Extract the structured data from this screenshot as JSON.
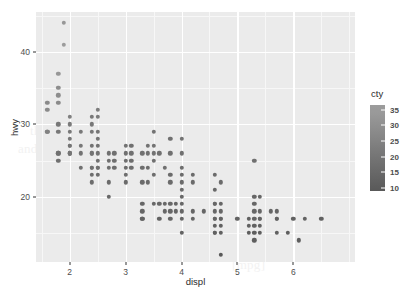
{
  "figure": {
    "panel_bg": "#ebebeb",
    "grid_color": "#ffffff",
    "point_color": "#4a4a4a"
  },
  "watermark": {
    "lines": [
      "the document text showing faintly behind the figure",
      "and a second line of body copy beneath the panel area",
      "Other introduction",
      "[mpg]"
    ]
  },
  "chart_data": {
    "type": "scatter",
    "title": "",
    "xlabel": "displ",
    "ylabel": "hwy",
    "xlim": [
      1.4,
      7.1
    ],
    "ylim": [
      11,
      45.5
    ],
    "xticks": [
      2,
      3,
      4,
      5,
      6
    ],
    "yticks": [
      20,
      30,
      40
    ],
    "grid": true,
    "legend": {
      "title": "cty",
      "position": "right",
      "type": "colorbar",
      "ticks": [
        35,
        30,
        25,
        20,
        15,
        10
      ],
      "range": [
        9,
        35
      ],
      "low_color": "#132b43",
      "high_color": "#56b1f7",
      "low_color_gray": "#595959",
      "high_color_gray": "#9c9c9c"
    },
    "color_by": "cty",
    "n_points": 234,
    "x": [
      1.8,
      1.8,
      2.0,
      2.0,
      2.8,
      2.8,
      3.1,
      1.8,
      1.8,
      2.0,
      2.0,
      2.8,
      2.8,
      3.1,
      3.1,
      2.8,
      3.1,
      4.2,
      5.3,
      5.3,
      5.3,
      5.7,
      6.0,
      5.7,
      5.7,
      6.2,
      6.2,
      7.0,
      5.3,
      5.3,
      5.7,
      6.5,
      2.4,
      2.4,
      3.1,
      3.5,
      3.6,
      2.4,
      3.0,
      3.3,
      3.3,
      3.3,
      3.3,
      3.3,
      3.8,
      3.8,
      3.8,
      4.0,
      3.7,
      3.7,
      3.9,
      3.9,
      4.7,
      4.7,
      4.7,
      5.2,
      5.2,
      3.9,
      4.7,
      4.7,
      4.7,
      5.2,
      5.7,
      5.9,
      4.7,
      4.7,
      4.7,
      4.7,
      4.7,
      4.7,
      5.2,
      5.2,
      5.7,
      5.9,
      4.6,
      5.4,
      5.4,
      4.0,
      4.0,
      4.6,
      5.0,
      4.2,
      4.2,
      4.6,
      4.6,
      4.6,
      5.4,
      5.4,
      3.8,
      3.8,
      4.0,
      4.0,
      4.6,
      4.6,
      4.6,
      4.6,
      5.4,
      1.6,
      1.6,
      1.6,
      1.6,
      1.6,
      1.8,
      1.8,
      1.8,
      2.0,
      2.4,
      2.4,
      2.4,
      2.4,
      2.5,
      2.5,
      3.3,
      2.0,
      2.0,
      2.0,
      2.0,
      2.7,
      2.7,
      2.7,
      3.0,
      3.7,
      4.0,
      4.7,
      4.7,
      4.7,
      5.7,
      6.1,
      4.0,
      4.2,
      4.4,
      4.6,
      5.4,
      5.4,
      5.4,
      4.0,
      4.0,
      4.6,
      5.0,
      2.4,
      2.4,
      2.5,
      2.5,
      3.5,
      3.5,
      3.0,
      3.0,
      3.5,
      3.3,
      3.3,
      4.0,
      5.6,
      3.1,
      3.8,
      3.8,
      3.8,
      5.3,
      2.5,
      2.5,
      2.5,
      2.5,
      2.5,
      2.5,
      2.2,
      2.2,
      2.5,
      2.5,
      2.5,
      2.5,
      2.5,
      2.5,
      2.7,
      2.7,
      3.4,
      3.4,
      4.0,
      4.7,
      2.2,
      2.2,
      2.4,
      2.4,
      3.0,
      3.0,
      3.5,
      2.2,
      2.2,
      2.4,
      2.4,
      3.0,
      3.0,
      3.3,
      1.8,
      1.8,
      1.8,
      1.8,
      1.8,
      4.7,
      5.7,
      2.7,
      2.7,
      2.7,
      3.4,
      3.4,
      4.0,
      4.0,
      2.0,
      2.0,
      2.0,
      2.0,
      2.8,
      1.9,
      2.0,
      2.0,
      2.0,
      2.0,
      2.5,
      2.5,
      2.8,
      2.8,
      1.9,
      1.9,
      2.0,
      2.0,
      2.5,
      2.5,
      1.8,
      1.8,
      2.0,
      2.0,
      2.8,
      2.8,
      3.6
    ],
    "y": [
      29,
      29,
      31,
      30,
      26,
      26,
      27,
      26,
      25,
      28,
      27,
      25,
      25,
      25,
      25,
      24,
      25,
      23,
      20,
      15,
      20,
      17,
      17,
      26,
      23,
      26,
      25,
      24,
      19,
      14,
      15,
      17,
      27,
      30,
      26,
      29,
      26,
      24,
      24,
      22,
      22,
      24,
      24,
      17,
      22,
      21,
      23,
      23,
      19,
      18,
      17,
      17,
      19,
      19,
      12,
      17,
      15,
      17,
      17,
      12,
      17,
      16,
      18,
      18,
      16,
      16,
      16,
      16,
      16,
      17,
      17,
      17,
      16,
      16,
      17,
      17,
      17,
      17,
      17,
      17,
      16,
      16,
      17,
      17,
      18,
      17,
      16,
      16,
      17,
      17,
      17,
      17,
      16,
      17,
      17,
      17,
      16,
      26,
      29,
      29,
      29,
      29,
      26,
      29,
      29,
      29,
      26,
      26,
      24,
      24,
      24,
      22,
      22,
      29,
      29,
      29,
      29,
      26,
      26,
      26,
      22,
      22,
      19,
      19,
      19,
      19,
      17,
      17,
      17,
      17,
      17,
      17,
      16,
      16,
      16,
      18,
      18,
      17,
      17,
      24,
      24,
      24,
      24,
      23,
      22,
      20,
      20,
      23,
      23,
      22,
      23,
      22,
      20,
      20,
      22,
      20,
      19,
      19,
      22,
      22,
      22,
      22,
      26,
      26,
      26,
      26,
      26,
      26,
      26,
      25,
      24,
      24,
      24,
      23,
      23,
      22,
      22,
      22,
      22,
      22,
      22,
      22,
      22,
      22,
      22,
      22,
      22,
      22,
      22,
      22,
      20,
      20,
      18,
      18,
      18,
      18,
      17,
      17,
      17,
      17,
      17,
      17,
      17,
      22,
      21,
      21,
      22,
      22,
      20,
      20,
      20,
      20,
      26,
      26,
      26,
      26,
      26,
      26,
      26,
      26,
      26,
      26,
      26,
      26,
      26,
      26,
      26,
      26,
      26,
      26,
      26,
      26,
      26,
      26,
      26,
      26,
      26,
      26,
      26,
      26,
      26,
      26,
      26,
      26,
      26,
      26,
      26,
      26,
      26,
      26,
      26,
      26,
      26,
      26,
      26,
      26,
      26,
      26,
      26,
      26,
      26,
      26,
      26,
      26,
      26,
      26,
      26,
      26,
      26,
      26,
      26,
      26,
      26,
      26,
      26,
      26,
      26,
      26,
      26,
      26,
      26,
      26,
      26,
      26,
      26,
      26,
      26,
      26,
      26,
      26,
      26,
      26,
      26,
      26,
      26,
      26,
      26
    ],
    "series_description": "mpg dataset: highway MPG versus engine displacement, points shaded by city MPG"
  },
  "points": [
    {
      "x": 1.6,
      "y": 33,
      "c": 28
    },
    {
      "x": 1.6,
      "y": 32,
      "c": 28
    },
    {
      "x": 1.6,
      "y": 29,
      "c": 24
    },
    {
      "x": 1.8,
      "y": 37,
      "c": 33
    },
    {
      "x": 1.8,
      "y": 35,
      "c": 29
    },
    {
      "x": 1.8,
      "y": 34,
      "c": 29
    },
    {
      "x": 1.8,
      "y": 33,
      "c": 28
    },
    {
      "x": 1.8,
      "y": 30,
      "c": 21
    },
    {
      "x": 1.8,
      "y": 29,
      "c": 21
    },
    {
      "x": 1.8,
      "y": 26,
      "c": 18
    },
    {
      "x": 1.8,
      "y": 26,
      "c": 18
    },
    {
      "x": 1.8,
      "y": 25,
      "c": 18
    },
    {
      "x": 1.9,
      "y": 44,
      "c": 33
    },
    {
      "x": 1.9,
      "y": 41,
      "c": 35
    },
    {
      "x": 2.0,
      "y": 31,
      "c": 24
    },
    {
      "x": 2.0,
      "y": 30,
      "c": 22
    },
    {
      "x": 2.0,
      "y": 29,
      "c": 21
    },
    {
      "x": 2.0,
      "y": 28,
      "c": 21
    },
    {
      "x": 2.0,
      "y": 27,
      "c": 21
    },
    {
      "x": 2.0,
      "y": 26,
      "c": 19
    },
    {
      "x": 2.0,
      "y": 26,
      "c": 19
    },
    {
      "x": 2.2,
      "y": 29,
      "c": 21
    },
    {
      "x": 2.2,
      "y": 26,
      "c": 19
    },
    {
      "x": 2.4,
      "y": 31,
      "c": 21
    },
    {
      "x": 2.4,
      "y": 30,
      "c": 21
    },
    {
      "x": 2.4,
      "y": 29,
      "c": 21
    },
    {
      "x": 2.4,
      "y": 27,
      "c": 19
    },
    {
      "x": 2.4,
      "y": 26,
      "c": 19
    },
    {
      "x": 2.4,
      "y": 24,
      "c": 18
    },
    {
      "x": 2.4,
      "y": 24,
      "c": 18
    },
    {
      "x": 2.4,
      "y": 23,
      "c": 17
    },
    {
      "x": 2.5,
      "y": 32,
      "c": 23
    },
    {
      "x": 2.5,
      "y": 31,
      "c": 22
    },
    {
      "x": 2.5,
      "y": 29,
      "c": 20
    },
    {
      "x": 2.5,
      "y": 27,
      "c": 19
    },
    {
      "x": 2.5,
      "y": 26,
      "c": 19
    },
    {
      "x": 2.5,
      "y": 24,
      "c": 18
    },
    {
      "x": 2.5,
      "y": 23,
      "c": 17
    },
    {
      "x": 2.7,
      "y": 26,
      "c": 18
    },
    {
      "x": 2.7,
      "y": 24,
      "c": 18
    },
    {
      "x": 2.7,
      "y": 22,
      "c": 16
    },
    {
      "x": 2.7,
      "y": 20,
      "c": 15
    },
    {
      "x": 2.8,
      "y": 25,
      "c": 18
    },
    {
      "x": 2.8,
      "y": 24,
      "c": 17
    },
    {
      "x": 3.0,
      "y": 26,
      "c": 18
    },
    {
      "x": 3.0,
      "y": 25,
      "c": 18
    },
    {
      "x": 3.0,
      "y": 24,
      "c": 17
    },
    {
      "x": 3.0,
      "y": 22,
      "c": 16
    },
    {
      "x": 3.1,
      "y": 27,
      "c": 18
    },
    {
      "x": 3.1,
      "y": 26,
      "c": 18
    },
    {
      "x": 3.1,
      "y": 25,
      "c": 17
    },
    {
      "x": 3.3,
      "y": 24,
      "c": 17
    },
    {
      "x": 3.3,
      "y": 22,
      "c": 16
    },
    {
      "x": 3.3,
      "y": 19,
      "c": 14
    },
    {
      "x": 3.3,
      "y": 17,
      "c": 14
    },
    {
      "x": 3.3,
      "y": 17,
      "c": 13
    },
    {
      "x": 3.4,
      "y": 27,
      "c": 19
    },
    {
      "x": 3.4,
      "y": 26,
      "c": 18
    },
    {
      "x": 3.4,
      "y": 22,
      "c": 16
    },
    {
      "x": 3.5,
      "y": 29,
      "c": 19
    },
    {
      "x": 3.5,
      "y": 26,
      "c": 19
    },
    {
      "x": 3.5,
      "y": 25,
      "c": 18
    },
    {
      "x": 3.5,
      "y": 23,
      "c": 17
    },
    {
      "x": 3.6,
      "y": 26,
      "c": 18
    },
    {
      "x": 3.6,
      "y": 19,
      "c": 15
    },
    {
      "x": 3.7,
      "y": 24,
      "c": 18
    },
    {
      "x": 3.7,
      "y": 19,
      "c": 15
    },
    {
      "x": 3.7,
      "y": 18,
      "c": 15
    },
    {
      "x": 3.8,
      "y": 28,
      "c": 18
    },
    {
      "x": 3.8,
      "y": 26,
      "c": 18
    },
    {
      "x": 3.8,
      "y": 23,
      "c": 16
    },
    {
      "x": 3.8,
      "y": 22,
      "c": 16
    },
    {
      "x": 3.8,
      "y": 18,
      "c": 14
    },
    {
      "x": 3.8,
      "y": 17,
      "c": 14
    },
    {
      "x": 3.9,
      "y": 19,
      "c": 14
    },
    {
      "x": 3.9,
      "y": 18,
      "c": 14
    },
    {
      "x": 4.0,
      "y": 28,
      "c": 19
    },
    {
      "x": 4.0,
      "y": 26,
      "c": 18
    },
    {
      "x": 4.0,
      "y": 24,
      "c": 17
    },
    {
      "x": 4.0,
      "y": 23,
      "c": 16
    },
    {
      "x": 4.0,
      "y": 21,
      "c": 16
    },
    {
      "x": 4.0,
      "y": 20,
      "c": 15
    },
    {
      "x": 4.0,
      "y": 19,
      "c": 15
    },
    {
      "x": 4.0,
      "y": 18,
      "c": 14
    },
    {
      "x": 4.0,
      "y": 17,
      "c": 14
    },
    {
      "x": 4.0,
      "y": 15,
      "c": 13
    },
    {
      "x": 4.2,
      "y": 23,
      "c": 16
    },
    {
      "x": 4.2,
      "y": 18,
      "c": 14
    },
    {
      "x": 4.2,
      "y": 17,
      "c": 14
    },
    {
      "x": 4.4,
      "y": 18,
      "c": 14
    },
    {
      "x": 4.6,
      "y": 23,
      "c": 16
    },
    {
      "x": 4.6,
      "y": 21,
      "c": 15
    },
    {
      "x": 4.6,
      "y": 19,
      "c": 14
    },
    {
      "x": 4.6,
      "y": 19,
      "c": 14
    },
    {
      "x": 4.6,
      "y": 17,
      "c": 13
    },
    {
      "x": 4.6,
      "y": 17,
      "c": 13
    },
    {
      "x": 4.6,
      "y": 15,
      "c": 12
    },
    {
      "x": 4.6,
      "y": 15,
      "c": 12
    },
    {
      "x": 4.7,
      "y": 22,
      "c": 16
    },
    {
      "x": 4.7,
      "y": 19,
      "c": 14
    },
    {
      "x": 4.7,
      "y": 18,
      "c": 14
    },
    {
      "x": 4.7,
      "y": 17,
      "c": 13
    },
    {
      "x": 4.7,
      "y": 16,
      "c": 12
    },
    {
      "x": 4.7,
      "y": 15,
      "c": 12
    },
    {
      "x": 4.7,
      "y": 12,
      "c": 9
    },
    {
      "x": 5.0,
      "y": 17,
      "c": 13
    },
    {
      "x": 5.2,
      "y": 17,
      "c": 12
    },
    {
      "x": 5.2,
      "y": 16,
      "c": 12
    },
    {
      "x": 5.2,
      "y": 15,
      "c": 11
    },
    {
      "x": 5.3,
      "y": 25,
      "c": 18
    },
    {
      "x": 5.3,
      "y": 20,
      "c": 14
    },
    {
      "x": 5.3,
      "y": 18,
      "c": 14
    },
    {
      "x": 5.3,
      "y": 17,
      "c": 13
    },
    {
      "x": 5.3,
      "y": 16,
      "c": 12
    },
    {
      "x": 5.3,
      "y": 15,
      "c": 11
    },
    {
      "x": 5.3,
      "y": 14,
      "c": 11
    },
    {
      "x": 5.4,
      "y": 20,
      "c": 14
    },
    {
      "x": 5.4,
      "y": 18,
      "c": 14
    },
    {
      "x": 5.4,
      "y": 17,
      "c": 13
    },
    {
      "x": 5.4,
      "y": 16,
      "c": 12
    },
    {
      "x": 5.4,
      "y": 15,
      "c": 11
    },
    {
      "x": 5.6,
      "y": 18,
      "c": 14
    },
    {
      "x": 5.7,
      "y": 18,
      "c": 14
    },
    {
      "x": 5.7,
      "y": 17,
      "c": 13
    },
    {
      "x": 5.7,
      "y": 15,
      "c": 12
    },
    {
      "x": 5.9,
      "y": 15,
      "c": 11
    },
    {
      "x": 6.0,
      "y": 17,
      "c": 12
    },
    {
      "x": 6.1,
      "y": 14,
      "c": 11
    },
    {
      "x": 6.2,
      "y": 17,
      "c": 13
    },
    {
      "x": 6.5,
      "y": 17,
      "c": 12
    },
    {
      "x": 1.6,
      "y": 29,
      "c": 25
    },
    {
      "x": 2.0,
      "y": 27,
      "c": 20
    },
    {
      "x": 2.2,
      "y": 27,
      "c": 21
    },
    {
      "x": 2.4,
      "y": 26,
      "c": 19
    },
    {
      "x": 2.5,
      "y": 28,
      "c": 20
    },
    {
      "x": 2.8,
      "y": 26,
      "c": 18
    },
    {
      "x": 3.0,
      "y": 27,
      "c": 19
    },
    {
      "x": 3.3,
      "y": 26,
      "c": 18
    },
    {
      "x": 3.5,
      "y": 27,
      "c": 19
    },
    {
      "x": 2.5,
      "y": 25,
      "c": 18
    },
    {
      "x": 2.0,
      "y": 26,
      "c": 20
    },
    {
      "x": 2.4,
      "y": 22,
      "c": 17
    },
    {
      "x": 3.3,
      "y": 18,
      "c": 14
    },
    {
      "x": 3.5,
      "y": 19,
      "c": 15
    },
    {
      "x": 3.8,
      "y": 19,
      "c": 15
    },
    {
      "x": 4.0,
      "y": 22,
      "c": 16
    },
    {
      "x": 4.6,
      "y": 18,
      "c": 14
    },
    {
      "x": 4.7,
      "y": 17,
      "c": 13
    },
    {
      "x": 5.4,
      "y": 17,
      "c": 13
    },
    {
      "x": 2.7,
      "y": 25,
      "c": 18
    },
    {
      "x": 3.1,
      "y": 24,
      "c": 17
    },
    {
      "x": 2.5,
      "y": 24,
      "c": 18
    },
    {
      "x": 3.4,
      "y": 24,
      "c": 17
    },
    {
      "x": 2.2,
      "y": 24,
      "c": 18
    },
    {
      "x": 4.6,
      "y": 16,
      "c": 12
    },
    {
      "x": 5.3,
      "y": 19,
      "c": 14
    },
    {
      "x": 5.7,
      "y": 17,
      "c": 13
    },
    {
      "x": 3.0,
      "y": 23,
      "c": 17
    },
    {
      "x": 3.6,
      "y": 17,
      "c": 13
    },
    {
      "x": 4.2,
      "y": 22,
      "c": 16
    }
  ]
}
